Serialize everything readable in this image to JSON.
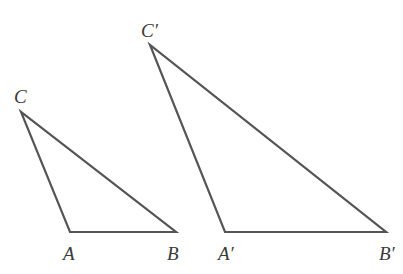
{
  "figure": {
    "width": 403,
    "height": 274,
    "background": "#ffffff",
    "stroke_color": "#555555",
    "stroke_width": 2.2
  },
  "triangles": [
    {
      "name": "ABC",
      "vertices": {
        "A": {
          "x": 70,
          "y": 232
        },
        "B": {
          "x": 176,
          "y": 232
        },
        "C": {
          "x": 21,
          "y": 112
        }
      },
      "labels": {
        "A": {
          "text": "A",
          "x": 63,
          "y": 244
        },
        "B": {
          "text": "B",
          "x": 167,
          "y": 244
        },
        "C": {
          "text": "C",
          "x": 14,
          "y": 87
        }
      }
    },
    {
      "name": "A′B′C′",
      "vertices": {
        "A": {
          "x": 225,
          "y": 232
        },
        "B": {
          "x": 386,
          "y": 232
        },
        "C": {
          "x": 150,
          "y": 45
        }
      },
      "labels": {
        "A": {
          "text": "A′",
          "x": 218,
          "y": 244
        },
        "B": {
          "text": "B′",
          "x": 379,
          "y": 244
        },
        "C": {
          "text": "C′",
          "x": 141,
          "y": 21
        }
      }
    }
  ]
}
